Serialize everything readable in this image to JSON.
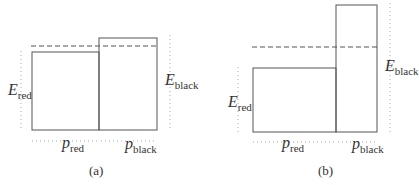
{
  "panels": [
    {
      "caption": "(a)",
      "labels": {
        "e_red": {
          "main": "E",
          "sub": "red"
        },
        "e_black": {
          "main": "E",
          "sub": "black"
        },
        "p_red": {
          "main": "p",
          "sub": "red"
        },
        "p_black": {
          "main": "p",
          "sub": "black"
        }
      }
    },
    {
      "caption": "(b)",
      "labels": {
        "e_red": {
          "main": "E",
          "sub": "red"
        },
        "e_black": {
          "main": "E",
          "sub": "black"
        },
        "p_red": {
          "main": "p",
          "sub": "red"
        },
        "p_black": {
          "main": "p",
          "sub": "black"
        }
      }
    }
  ],
  "colors": {
    "stroke": "#555555",
    "dotted": "#999999",
    "dashed": "#555555"
  }
}
